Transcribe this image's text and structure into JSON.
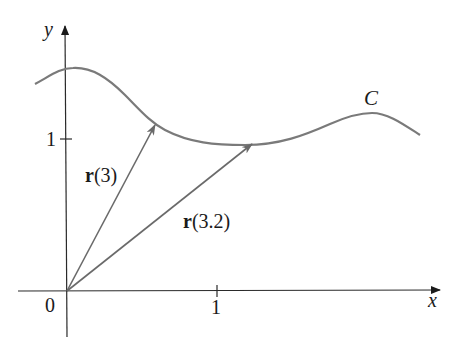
{
  "diagram": {
    "axes": {
      "x_label": "x",
      "y_label": "y",
      "origin_label": "0",
      "x_tick_label": "1",
      "y_tick_label": "1"
    },
    "curve": {
      "label": "C"
    },
    "vectors": [
      {
        "name_bold": "r",
        "arg": "(3)"
      },
      {
        "name_bold": "r",
        "arg": "(3.2)"
      }
    ],
    "colors": {
      "axis": "#2a2a2a",
      "curve": "#7a7a7a",
      "vector": "#6a6a6a",
      "text": "#1a1a1a"
    }
  }
}
